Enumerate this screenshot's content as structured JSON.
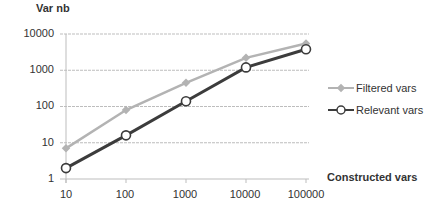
{
  "chart_data": {
    "type": "line",
    "title": "",
    "xlabel": "Constructed vars",
    "ylabel": "Var nb",
    "x_scale": "log",
    "y_scale": "log",
    "x": [
      10,
      100,
      1000,
      10000,
      100000
    ],
    "x_tick_labels": [
      "10",
      "100",
      "1000",
      "10000",
      "100000"
    ],
    "y_tick_labels": [
      "1",
      "10",
      "100",
      "1000",
      "10000"
    ],
    "ylim": [
      1,
      10000
    ],
    "grid": true,
    "legend_position": "right",
    "series": [
      {
        "name": "Filtered vars",
        "values": [
          7,
          80,
          450,
          2200,
          5500
        ],
        "color": "#b3b3b3",
        "marker": "filled-diamond"
      },
      {
        "name": "Relevant vars",
        "values": [
          2,
          16,
          140,
          1200,
          3800
        ],
        "color": "#3c3c3c",
        "marker": "open-circle"
      }
    ]
  }
}
